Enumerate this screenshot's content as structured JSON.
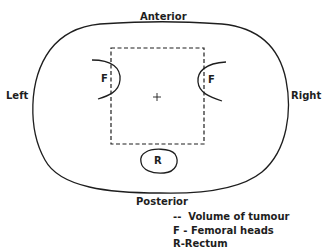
{
  "diagram": {
    "labels": {
      "anterior": "Anterior",
      "posterior": "Posterior",
      "left": "Left",
      "right": "Right",
      "femoral_left": "F",
      "femoral_right": "F",
      "rectum": "R",
      "isocentre": "+"
    },
    "legend": [
      {
        "key": "--",
        "sep": "",
        "text": "Volume of tumour"
      },
      {
        "key": "F",
        "sep": "-",
        "text": "Femoral heads"
      },
      {
        "key": "R",
        "sep": "-",
        "text": "Rectum"
      }
    ],
    "colors": {
      "ink": "#1e1e1e",
      "background": "#ffffff"
    }
  }
}
